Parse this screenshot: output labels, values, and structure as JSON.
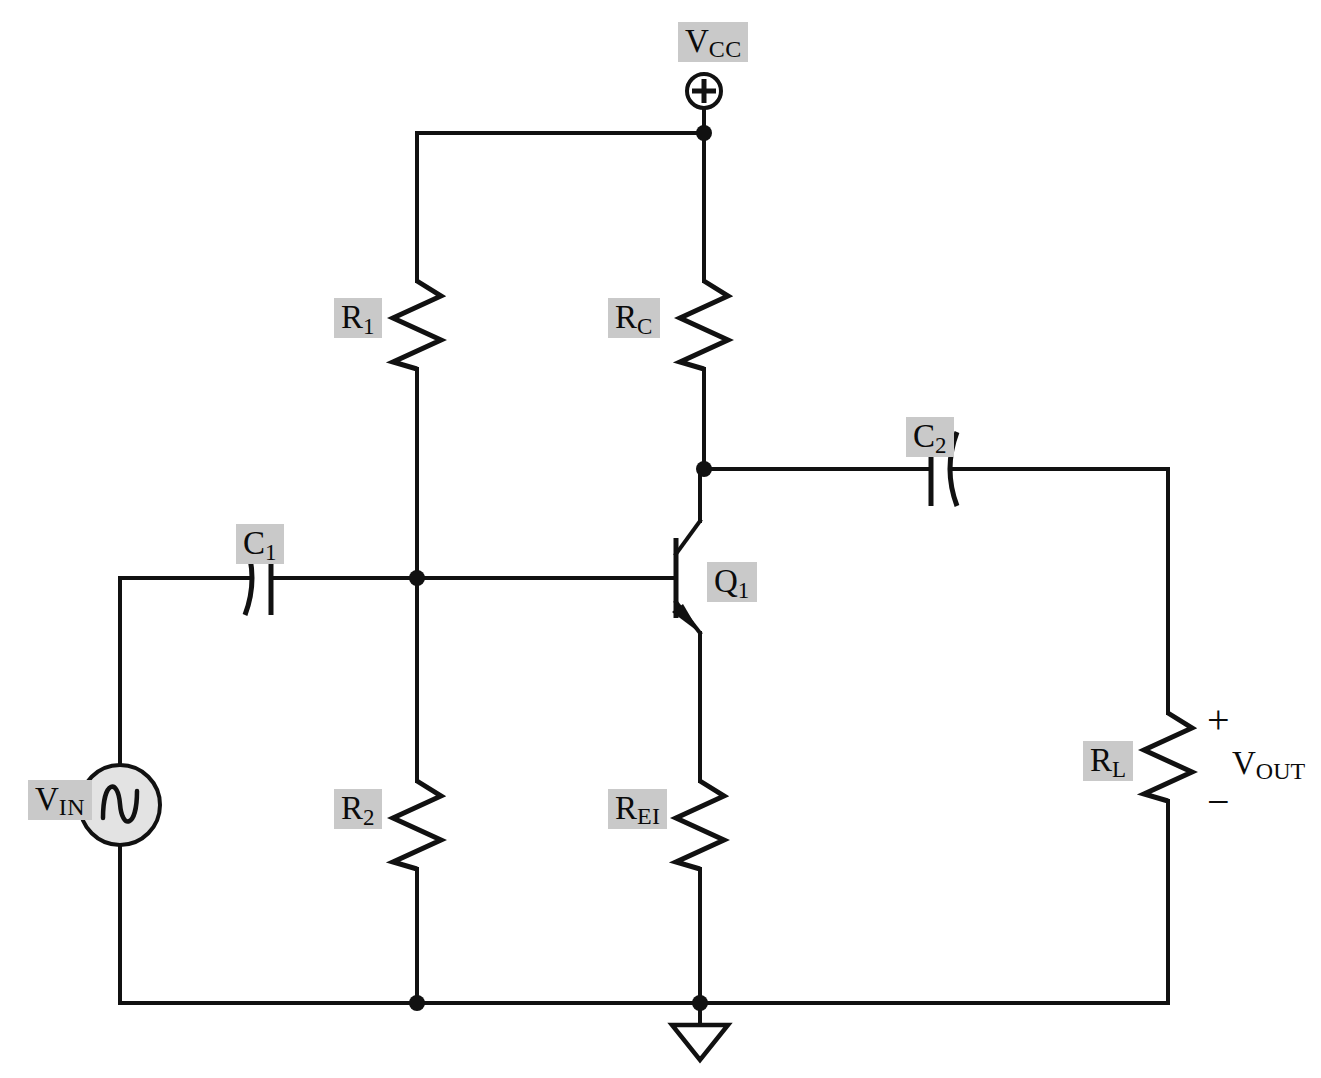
{
  "diagram": {
    "background_color": "#ffffff",
    "wire_color": "#111111",
    "label_highlight_color": "#c9c9c9",
    "source_fill_color": "#e3e3e3"
  },
  "labels": {
    "vcc": {
      "base": "V",
      "sub": "CC"
    },
    "r1": {
      "base": "R",
      "sub": "1"
    },
    "rc": {
      "base": "R",
      "sub": "C"
    },
    "c1": {
      "base": "C",
      "sub": "1"
    },
    "c2": {
      "base": "C",
      "sub": "2"
    },
    "q1": {
      "base": "Q",
      "sub": "1"
    },
    "r2": {
      "base": "R",
      "sub": "2"
    },
    "rei": {
      "base": "R",
      "sub": "EI"
    },
    "rl": {
      "base": "R",
      "sub": "L"
    },
    "vin": {
      "base": "V",
      "sub": "IN"
    },
    "vout": {
      "base": "V",
      "sub": "OUT"
    },
    "plus_sign": "+",
    "minus_sign": "−",
    "supply_terminal": "⊕"
  },
  "components": [
    {
      "id": "vcc-terminal",
      "type": "supply-terminal",
      "label": "V_CC"
    },
    {
      "id": "r1",
      "type": "resistor",
      "label": "R_1",
      "orientation": "vertical"
    },
    {
      "id": "rc",
      "type": "resistor",
      "label": "R_C",
      "orientation": "vertical"
    },
    {
      "id": "r2",
      "type": "resistor",
      "label": "R_2",
      "orientation": "vertical"
    },
    {
      "id": "rei",
      "type": "resistor",
      "label": "R_EI",
      "orientation": "vertical"
    },
    {
      "id": "rl",
      "type": "resistor",
      "label": "R_L",
      "orientation": "vertical"
    },
    {
      "id": "c1",
      "type": "capacitor",
      "label": "C_1",
      "orientation": "horizontal"
    },
    {
      "id": "c2",
      "type": "capacitor",
      "label": "C_2",
      "orientation": "horizontal"
    },
    {
      "id": "q1",
      "type": "npn-transistor",
      "label": "Q_1"
    },
    {
      "id": "vin",
      "type": "ac-voltage-source",
      "label": "V_IN"
    },
    {
      "id": "gnd",
      "type": "ground",
      "label": ""
    }
  ]
}
